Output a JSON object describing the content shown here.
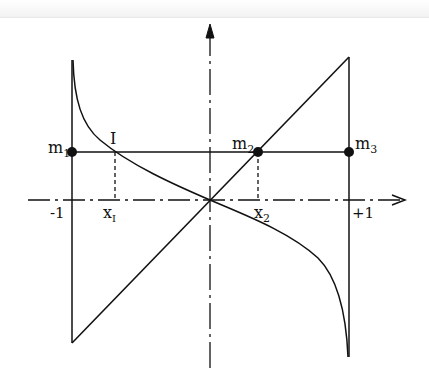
{
  "diagram": {
    "type": "function-graph",
    "colors": {
      "ink": "#111111",
      "background": "#ffffff"
    },
    "axes": {
      "x_axis": {
        "style": "dash-dot",
        "arrow": "right"
      },
      "y_axis": {
        "style": "dash-dot",
        "arrow": "up"
      },
      "tick_labels": {
        "left": "-1",
        "right": "+1"
      }
    },
    "points": {
      "m1": {
        "label": "m",
        "sub": "1"
      },
      "m2": {
        "label": "m",
        "sub": "2"
      },
      "m3": {
        "label": "m",
        "sub": "3"
      },
      "I": {
        "label": "I"
      }
    },
    "x_labels": {
      "xI": {
        "label": "x",
        "sub": "I"
      },
      "x2": {
        "label": "x",
        "sub": "2"
      }
    }
  }
}
